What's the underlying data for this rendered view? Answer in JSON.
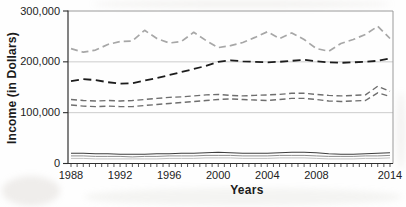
{
  "figure": {
    "ylabel": "Income (in Dollars)",
    "xlabel": "Years",
    "background_color": "#fefefe",
    "plot_border_color": "#9a9a9a",
    "axis_color": "#2f2f2f",
    "gridline_color": "#c6c6c6",
    "tick_label_color": "#222222"
  },
  "chart_data": {
    "type": "line",
    "title": "",
    "xlabel": "Years",
    "ylabel": "Income (in Dollars)",
    "xlim": [
      1988,
      2014
    ],
    "ylim": [
      0,
      300000
    ],
    "grid": "horizontal-at-100000-and-200000",
    "legend": "none",
    "y_ticks": [
      0,
      100000,
      200000,
      300000
    ],
    "y_tick_labels": [
      "0",
      "100,000",
      "200,000",
      "300,000"
    ],
    "x_tick_years": [
      1988,
      1992,
      1996,
      2000,
      2004,
      2008,
      2014
    ],
    "x_tick_labels": [
      "1988",
      "1992",
      "1996",
      "2000",
      "2004",
      "2008",
      "2014"
    ],
    "x_minor_tick_step_years": 0.5,
    "years": [
      1988,
      1989,
      1990,
      1991,
      1992,
      1993,
      1994,
      1995,
      1996,
      1997,
      1998,
      1999,
      2000,
      2001,
      2002,
      2003,
      2004,
      2005,
      2006,
      2007,
      2008,
      2009,
      2010,
      2011,
      2012,
      2013,
      2014
    ],
    "values_unit": "USD",
    "series": [
      {
        "name": "top",
        "style": "dashed",
        "color": "#a7a7a7",
        "width": 1.7,
        "dash": "7 4",
        "values": [
          226000,
          219000,
          223000,
          234000,
          240000,
          241000,
          262000,
          246000,
          237000,
          240000,
          258000,
          242000,
          228000,
          232000,
          238000,
          248000,
          259000,
          246000,
          257000,
          244000,
          226000,
          221000,
          236000,
          244000,
          254000,
          270000,
          246000
        ]
      },
      {
        "name": "second",
        "style": "dashed",
        "color": "#1c1c1c",
        "width": 1.8,
        "dash": "8 4.5",
        "values": [
          162000,
          166000,
          164000,
          160000,
          157000,
          158000,
          163000,
          168000,
          174000,
          180000,
          186000,
          192000,
          200000,
          203000,
          201000,
          200000,
          199000,
          200000,
          202000,
          204000,
          201000,
          199000,
          198000,
          199000,
          200000,
          202000,
          207000
        ]
      },
      {
        "name": "third",
        "style": "dashed",
        "color": "#6e6e6e",
        "width": 1.4,
        "dash": "6 3.5",
        "values": [
          126000,
          124000,
          123000,
          124000,
          123000,
          124000,
          126000,
          128000,
          130000,
          131000,
          133000,
          135000,
          136000,
          134000,
          133000,
          134000,
          135000,
          136000,
          138000,
          138000,
          136000,
          134000,
          133000,
          134000,
          135000,
          152000,
          142000
        ]
      },
      {
        "name": "fourth",
        "style": "dashed",
        "color": "#6e6e6e",
        "width": 1.4,
        "dash": "6 3.5",
        "values": [
          115000,
          113000,
          112000,
          113000,
          112000,
          112000,
          114000,
          116000,
          118000,
          120000,
          122000,
          124000,
          126000,
          127000,
          126000,
          125000,
          124000,
          126000,
          128000,
          128000,
          126000,
          123000,
          122000,
          123000,
          124000,
          139000,
          132000
        ]
      },
      {
        "name": "bottom-1",
        "style": "solid",
        "color": "#3f3f3f",
        "width": 1.1,
        "dash": "",
        "values": [
          20000,
          20000,
          19000,
          19000,
          18000,
          18000,
          18000,
          19000,
          19000,
          20000,
          20000,
          21000,
          22000,
          21000,
          20000,
          20000,
          20000,
          21000,
          22000,
          22000,
          21000,
          19000,
          18000,
          18000,
          19000,
          20000,
          21000
        ]
      },
      {
        "name": "bottom-2",
        "style": "solid",
        "color": "#8f8f8f",
        "width": 1.0,
        "dash": "",
        "values": [
          15000,
          15000,
          14000,
          14000,
          14000,
          13000,
          14000,
          14000,
          15000,
          15000,
          15000,
          16000,
          16000,
          16000,
          15000,
          15000,
          15000,
          16000,
          16000,
          16000,
          15000,
          14000,
          14000,
          14000,
          15000,
          15000,
          16000
        ]
      },
      {
        "name": "bottom-3",
        "style": "solid",
        "color": "#c2c2c2",
        "width": 1.0,
        "dash": "",
        "values": [
          10000,
          10000,
          9000,
          9000,
          9000,
          9000,
          9000,
          9000,
          10000,
          10000,
          10000,
          11000,
          11000,
          11000,
          10000,
          10000,
          10000,
          11000,
          11000,
          11000,
          10000,
          9000,
          9000,
          9000,
          10000,
          10000,
          11000
        ]
      }
    ]
  }
}
